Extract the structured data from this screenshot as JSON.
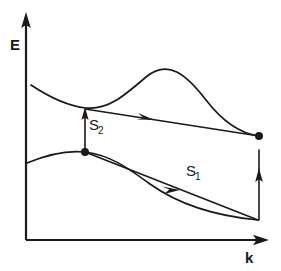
{
  "figure": {
    "background_color": "#ffffff",
    "ink_color": "#1a1a1a",
    "width": 281,
    "height": 271
  },
  "axes": {
    "y_label": "E",
    "x_label": "k",
    "y_axis": {
      "x": 26,
      "y_top": 14,
      "y_bottom": 240,
      "arrow": "up"
    },
    "x_axis": {
      "y": 240,
      "x_left": 26,
      "x_right": 268,
      "arrow": "right"
    },
    "ticks": [],
    "grid": false
  },
  "labels": {
    "s1": {
      "base": "S",
      "sub": "1",
      "x": 186,
      "y": 176
    },
    "s2": {
      "base": "S",
      "sub": "2",
      "x": 89,
      "y": 130
    },
    "y_axis_label": {
      "text": "E",
      "x": 10,
      "y": 50
    },
    "x_axis_label": {
      "text": "k",
      "x": 245,
      "y": 262
    }
  },
  "chart_data": {
    "type": "line",
    "xlabel": "k",
    "ylabel": "E",
    "grid": false,
    "legend": "none",
    "note": "Schematic E(k) dispersion: an upper conduction band and a lower valence band, connected by two labelled transition arrows S1 and S2. Coordinates are in screen pixels (y increases downward).",
    "series": [
      {
        "name": "upper-band",
        "role": "conduction band",
        "path": "M 31 85 C 52 99, 68 106, 86 108 C 108 110, 124 96, 146 77 C 168 59, 186 74, 206 100 C 226 126, 244 134, 259 136",
        "points": [
          {
            "x": 31,
            "y": 85
          },
          {
            "x": 86,
            "y": 108
          },
          {
            "x": 146,
            "y": 77
          },
          {
            "x": 206,
            "y": 100
          },
          {
            "x": 259,
            "y": 136
          }
        ]
      },
      {
        "name": "lower-band",
        "role": "valence band",
        "path": "M 27 163 C 46 155, 66 150, 85 152 C 110 155, 128 168, 150 184 C 178 204, 216 216, 258 220",
        "points": [
          {
            "x": 27,
            "y": 163
          },
          {
            "x": 85,
            "y": 152
          },
          {
            "x": 150,
            "y": 184
          },
          {
            "x": 258,
            "y": 220
          }
        ]
      },
      {
        "name": "s2-transition-horizontal",
        "role": "upper transition path with rightward arrow",
        "path": "M 85 109 L 259 136",
        "arrow_at": {
          "x": 150,
          "y": 119,
          "direction": "right"
        }
      },
      {
        "name": "s1-transition-horizontal",
        "role": "lower transition path with rightward arrow",
        "path": "M 85 152 L 258 220",
        "arrow_at": {
          "x": 176,
          "y": 188,
          "direction": "right"
        }
      },
      {
        "name": "s2-vertical-arrow",
        "role": "vertical excitation S2",
        "path": "M 85 152 L 85 110",
        "arrow_at": {
          "x": 85,
          "y": 110,
          "direction": "up"
        }
      },
      {
        "name": "right-vertical-arrow",
        "role": "vertical recombination at right edge",
        "path": "M 259 220 L 259 137",
        "arrow_at": {
          "x": 259,
          "y": 137,
          "direction": "up"
        }
      }
    ],
    "markers": [
      {
        "name": "left-node",
        "x": 85,
        "y": 152,
        "r": 4
      },
      {
        "name": "right-node",
        "x": 259,
        "y": 136,
        "r": 4
      }
    ]
  }
}
